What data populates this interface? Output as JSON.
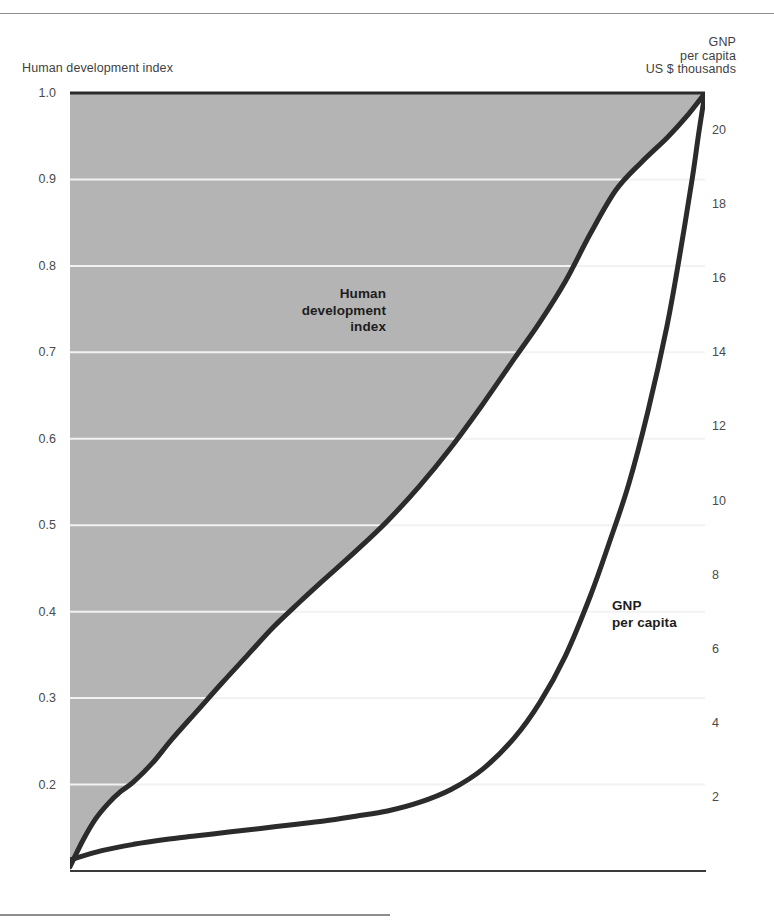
{
  "chart_data": {
    "type": "area",
    "title": "",
    "subtitle": "",
    "xlabel": "",
    "grid": true,
    "legend_position": "inline-annotations",
    "axes": {
      "left": {
        "label": "Human development index",
        "ticks": [
          "1.0",
          "0.9",
          "0.8",
          "0.7",
          "0.6",
          "0.5",
          "0.4",
          "0.3",
          "0.2"
        ],
        "tick_values": [
          1.0,
          0.9,
          0.8,
          0.7,
          0.6,
          0.5,
          0.4,
          0.3,
          0.2
        ],
        "range": [
          0.1,
          1.0
        ]
      },
      "right": {
        "label_line1": "GNP",
        "label_line2": "per capita",
        "label_line3": "US $ thousands",
        "ticks": [
          "20",
          "18",
          "16",
          "14",
          "12",
          "10",
          "8",
          "6",
          "4",
          "2"
        ],
        "tick_values": [
          20,
          18,
          16,
          14,
          12,
          10,
          8,
          6,
          4,
          2
        ],
        "range": [
          0,
          21
        ]
      }
    },
    "series": [
      {
        "name": "Human development index",
        "annotation_lines": [
          "Human",
          "development",
          "index"
        ],
        "axis": "left",
        "color": "#2b2b2b",
        "fill_above": "#b4b4b4",
        "x": [
          0,
          2,
          4,
          6,
          8,
          10,
          13,
          16,
          20,
          24,
          28,
          32,
          36,
          40,
          45,
          50,
          55,
          60,
          65,
          70,
          74,
          78,
          82,
          86,
          90,
          94,
          97,
          100
        ],
        "y": [
          0.105,
          0.135,
          0.16,
          0.178,
          0.192,
          0.203,
          0.225,
          0.252,
          0.285,
          0.318,
          0.35,
          0.382,
          0.41,
          0.437,
          0.47,
          0.505,
          0.545,
          0.59,
          0.64,
          0.693,
          0.735,
          0.782,
          0.838,
          0.888,
          0.92,
          0.948,
          0.972,
          1.0
        ]
      },
      {
        "name": "GNP per capita",
        "annotation_lines": [
          "GNP",
          "per capita"
        ],
        "axis": "right",
        "color": "#2b2b2b",
        "fill_below": "#c8c8c8",
        "x": [
          0,
          5,
          10,
          15,
          20,
          25,
          30,
          35,
          40,
          45,
          50,
          55,
          60,
          65,
          70,
          74,
          78,
          82,
          85,
          88,
          91,
          94,
          96,
          98,
          99,
          100
        ],
        "y": [
          0.3,
          0.55,
          0.72,
          0.85,
          0.95,
          1.05,
          1.15,
          1.25,
          1.35,
          1.48,
          1.62,
          1.85,
          2.2,
          2.75,
          3.6,
          4.55,
          5.8,
          7.45,
          8.9,
          10.45,
          12.4,
          14.7,
          16.6,
          18.7,
          19.9,
          21.0
        ]
      }
    ]
  },
  "plot_geometry": {
    "left": 70,
    "right": 705,
    "top": 93,
    "bottom": 871
  },
  "colors": {
    "fill_left": "#b4b4b4",
    "fill_right": "#c8c8c8",
    "curve": "#2b2b2b",
    "gridline": "#f2f2f2",
    "rule": "#8e8e8e",
    "text": "#4a4a4a"
  }
}
